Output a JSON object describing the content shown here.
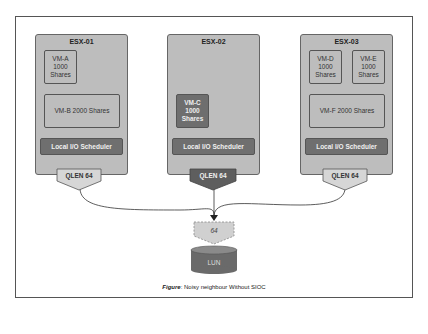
{
  "hosts": [
    {
      "name": "ESX-01",
      "vms": [
        {
          "label": "VM-A\n1000\nShares"
        },
        {
          "label": "VM-B 2000 Shares"
        }
      ],
      "scheduler": "Local I/O Scheduler",
      "qlen": "QLEN 64"
    },
    {
      "name": "ESX-02",
      "vms": [
        {
          "label": "VM-C\n1000\nShares"
        }
      ],
      "scheduler": "Local I/O Scheduler",
      "qlen": "QLEN 64"
    },
    {
      "name": "ESX-03",
      "vms": [
        {
          "label": "VM-D\n1000\nShares"
        },
        {
          "label": "VM-E\n1000\nShares"
        },
        {
          "label": "VM-F 2000 Shares"
        }
      ],
      "scheduler": "Local I/O Scheduler",
      "qlen": "QLEN 64"
    }
  ],
  "storage": {
    "queue_depth": "64",
    "lun": "LUN"
  },
  "caption": {
    "prefix": "Figure",
    "text": ": Noisy neighbour Without SIOC"
  },
  "colors": {
    "host_bg": "#bdbdbd",
    "dark": "#6e6e6e",
    "queue_fill": "#d0d0d0"
  }
}
